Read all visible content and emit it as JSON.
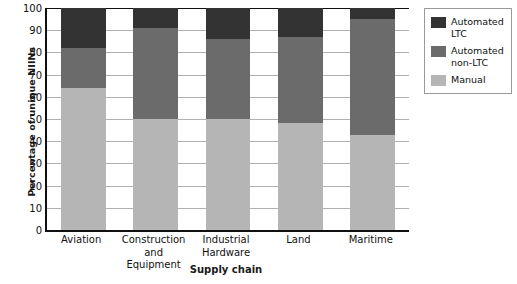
{
  "chart_data": {
    "type": "bar",
    "stacked": true,
    "title": "",
    "xlabel": "Supply chain",
    "ylabel": "Percentage of unique NIINs",
    "ylim": [
      0,
      100
    ],
    "ytick_labels": [
      "100",
      "90",
      "80",
      "70",
      "60",
      "50",
      "40",
      "30",
      "20",
      "10",
      "0"
    ],
    "yticks": [
      100,
      90,
      80,
      70,
      60,
      50,
      40,
      30,
      20,
      10,
      0
    ],
    "grid": true,
    "legend_position": "right",
    "categories": [
      "Aviation",
      "Construction and Equipment",
      "Industrial Hardware",
      "Land",
      "Maritime"
    ],
    "series": [
      {
        "name": "Automated LTC",
        "color": "#333333",
        "values": [
          18,
          9,
          14,
          13,
          5
        ]
      },
      {
        "name": "Automated non-LTC",
        "color": "#6b6b6b",
        "values": [
          18,
          41,
          36,
          39,
          52
        ]
      },
      {
        "name": "Manual",
        "color": "#b5b5b5",
        "values": [
          64,
          50,
          50,
          48,
          43
        ]
      }
    ]
  },
  "legend": {
    "items": [
      {
        "label": "Automated LTC",
        "color": "#333333"
      },
      {
        "label": "Automated non-LTC",
        "color": "#6b6b6b"
      },
      {
        "label": "Manual",
        "color": "#b5b5b5"
      }
    ]
  },
  "colors": {
    "automated_ltc": "#333333",
    "automated_non_ltc": "#6b6b6b",
    "manual": "#b5b5b5",
    "axis": "#111111",
    "gridline": "#b0b0b0",
    "background": "#ffffff"
  }
}
